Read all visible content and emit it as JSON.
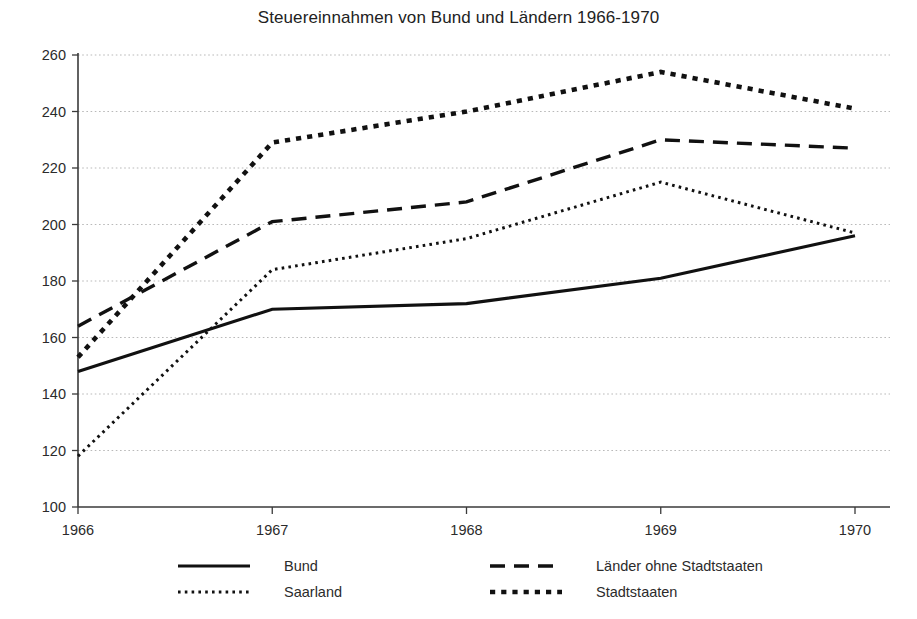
{
  "chart_data": {
    "type": "line",
    "title": "Steuereinnahmen von Bund und Ländern 1966-1970",
    "xlabel": "",
    "ylabel": "",
    "categories": [
      "1966",
      "1967",
      "1968",
      "1969",
      "1970"
    ],
    "x": [
      1966,
      1967,
      1968,
      1969,
      1970
    ],
    "xlim": [
      1966,
      1970
    ],
    "ylim": [
      100,
      260
    ],
    "yticks": [
      100,
      120,
      140,
      160,
      180,
      200,
      220,
      240,
      260
    ],
    "ytick_labels": [
      "100",
      "120",
      "140",
      "160",
      "180",
      "200",
      "220",
      "240",
      "260"
    ],
    "xtick_labels": [
      "1966",
      "1967",
      "1968",
      "1969",
      "1970"
    ],
    "grid": true,
    "grid_axis": "y",
    "legend_position": "bottom",
    "legend_columns": 2,
    "series": [
      {
        "name": "Bund",
        "style": "solid",
        "color": "#111111",
        "values": [
          148,
          170,
          172,
          181,
          196
        ]
      },
      {
        "name": "Länder ohne Stadtstaaten",
        "style": "dashed",
        "color": "#111111",
        "values": [
          164,
          201,
          208,
          230,
          227
        ]
      },
      {
        "name": "Saarland",
        "style": "dotted-fine",
        "color": "#111111",
        "values": [
          118,
          184,
          195,
          215,
          197
        ]
      },
      {
        "name": "Stadtstaaten",
        "style": "dotted-thick",
        "color": "#111111",
        "values": [
          153,
          229,
          240,
          254,
          241
        ]
      }
    ]
  },
  "legend": {
    "entries": [
      {
        "label": "Bund",
        "style": "solid"
      },
      {
        "label": "Länder ohne Stadtstaaten",
        "style": "dashed"
      },
      {
        "label": "Saarland",
        "style": "dotted-fine"
      },
      {
        "label": "Stadtstaaten",
        "style": "dotted-thick"
      }
    ]
  },
  "colors": {
    "series": "#111111",
    "axis": "#3a3a3a",
    "grid": "#b9b9b9",
    "text": "#2b2b2b",
    "background": "#ffffff"
  }
}
